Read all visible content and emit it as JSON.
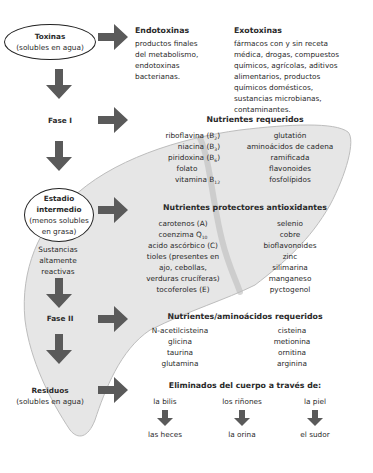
{
  "colors": {
    "arrow": "#5a5a5a",
    "liver_fill": "#e6e6e6",
    "liver_stroke": "#bdbdbd",
    "text": "#2a2a2a"
  },
  "left_column": {
    "toxinas": {
      "title": "Toxinas",
      "subtitle": "(solubles en agua)"
    },
    "fase1": {
      "title": "Fase I"
    },
    "estadio": {
      "line1": "Estadio",
      "line2": "intermedio",
      "line3": "(menos solubles",
      "line4": "en grasa)"
    },
    "sustancias": {
      "line1": "Sustancias",
      "line2": "altamente",
      "line3": "reactivas"
    },
    "fase2": {
      "title": "Fase II"
    },
    "residuos": {
      "title": "Residuos",
      "subtitle": "(solubles en agua)"
    }
  },
  "endotoxinas": {
    "title": "Endotoxinas",
    "lines": [
      "productos finales",
      "del metabolismo,",
      "endotoxinas",
      "bacterianas."
    ]
  },
  "exotoxinas": {
    "title": "Exotoxinas",
    "lines": [
      "fármacos con y sin receta",
      "médica, drogas, compuestos",
      "químicos, agrícolas, aditivos",
      "alimentarios, productos",
      "químicos domésticos,",
      "sustancias microbianas,",
      "contaminantes."
    ]
  },
  "nutrientes_requeridos": {
    "title": "Nutrientes requeridos",
    "left": [
      {
        "text": "riboflavina (B",
        "sub": "2",
        "after": ")"
      },
      {
        "text": "niacina (B",
        "sub": "3",
        "after": ")"
      },
      {
        "text": "piridoxina (B",
        "sub": "6",
        "after": ")"
      },
      {
        "text": "folato",
        "sub": "",
        "after": ""
      },
      {
        "text": "vitamina B",
        "sub": "12",
        "after": ""
      }
    ],
    "right": [
      "glutatión",
      "aminoácidos de cadena",
      "ramificada",
      "flavonoides",
      "fosfolípidos"
    ]
  },
  "antioxidantes": {
    "title": "Nutrientes protectores antioxidantes",
    "left": [
      {
        "text": "carotenos (A)",
        "sub": "",
        "after": ""
      },
      {
        "text": "coenzima Q",
        "sub": "10",
        "after": ""
      },
      {
        "text": "acido ascórbico (C)",
        "sub": "",
        "after": ""
      },
      {
        "text": "tioles (presentes en",
        "sub": "",
        "after": ""
      },
      {
        "text": "ajo, cebollas,",
        "sub": "",
        "after": ""
      },
      {
        "text": "verduras crucíferas)",
        "sub": "",
        "after": ""
      },
      {
        "text": "tocoferoles (E)",
        "sub": "",
        "after": ""
      }
    ],
    "right": [
      "selenio",
      "cobre",
      "bioflavonoides",
      "zinc",
      "silimarina",
      "manganeso",
      "pyctogenol"
    ]
  },
  "aminoacidos": {
    "title": "Nutrientes/aminoácidos requeridos",
    "left": [
      "N-acetilcisteina",
      "glicina",
      "taurina",
      "glutamina"
    ],
    "right": [
      "cisteina",
      "metionina",
      "ornitina",
      "arginina"
    ]
  },
  "eliminados": {
    "title": "Eliminados del cuerpo a través de:",
    "routes": [
      {
        "from": "la bilis",
        "to": "las heces"
      },
      {
        "from": "los riñones",
        "to": "la orina"
      },
      {
        "from": "la piel",
        "to": "el sudor"
      }
    ]
  }
}
